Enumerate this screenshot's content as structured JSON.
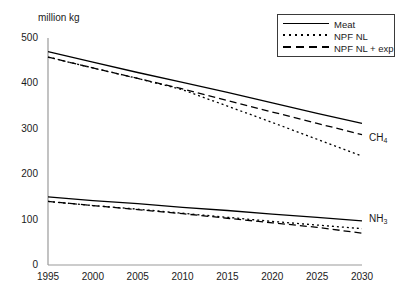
{
  "chart_data": {
    "type": "line",
    "title": "",
    "ylabel": "million kg",
    "xlabel": "",
    "xlim": [
      1995,
      2030
    ],
    "ylim": [
      0,
      500
    ],
    "grid": false,
    "x": [
      1995,
      2000,
      2005,
      2010,
      2015,
      2020,
      2025,
      2030
    ],
    "yticks": [
      "0",
      "100",
      "200",
      "300",
      "400",
      "500"
    ],
    "xticks": [
      "1995",
      "2000",
      "2005",
      "2010",
      "2015",
      "2020",
      "2025",
      "2030"
    ],
    "legend": {
      "position": "top-right",
      "entries": [
        {
          "label": "Meat",
          "style": "solid"
        },
        {
          "label": "NPF NL",
          "style": "dotted"
        },
        {
          "label": "NPF NL + exp",
          "style": "dashed"
        }
      ]
    },
    "groups": [
      {
        "name": "CH4",
        "annotation": "CH",
        "annotation_sub": "4",
        "series": [
          {
            "name": "Meat",
            "style": "solid",
            "values": [
              470,
              447,
              424,
              402,
              380,
              357,
              334,
              312
            ]
          },
          {
            "name": "NPF NL",
            "style": "dotted",
            "values": [
              458,
              434,
              411,
              386,
              350,
              314,
              277,
              240
            ]
          },
          {
            "name": "NPF NL + exp",
            "style": "dashed",
            "values": [
              458,
              434,
              411,
              388,
              362,
              337,
              312,
              287
            ]
          }
        ]
      },
      {
        "name": "NH3",
        "annotation": "NH",
        "annotation_sub": "3",
        "series": [
          {
            "name": "Meat",
            "style": "solid",
            "values": [
              150,
              142,
              135,
              127,
              120,
              112,
              105,
              97
            ]
          },
          {
            "name": "NPF NL",
            "style": "dotted",
            "values": [
              140,
              131,
              123,
              114,
              105,
              96,
              88,
              80
            ]
          },
          {
            "name": "NPF NL + exp",
            "style": "dashed",
            "values": [
              140,
              131,
              122,
              113,
              103,
              93,
              83,
              70
            ]
          }
        ]
      }
    ]
  },
  "axis": {
    "y_title": "million kg"
  },
  "annotations": {
    "ch4": "CH",
    "ch4_sub": "4",
    "nh3": "NH",
    "nh3_sub": "3"
  }
}
